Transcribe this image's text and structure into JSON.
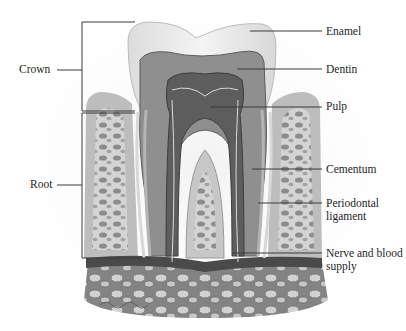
{
  "diagram": {
    "left_labels": [
      {
        "id": "crown",
        "text": "Crown"
      },
      {
        "id": "root",
        "text": "Root"
      }
    ],
    "right_labels": [
      {
        "id": "enamel",
        "text": "Enamel"
      },
      {
        "id": "dentin",
        "text": "Dentin"
      },
      {
        "id": "pulp",
        "text": "Pulp"
      },
      {
        "id": "cementum",
        "text": "Cementum"
      },
      {
        "id": "periodontal",
        "text": "Periodontal ligament"
      },
      {
        "id": "nerve",
        "text": "Nerve and blood supply"
      }
    ],
    "colors": {
      "background": "#ffffff",
      "enamel": "#ececec",
      "dentin": "#8f8f8f",
      "pulp": "#5e5e5e",
      "bone": "#d6d6d6",
      "gum": "#b8b8b8",
      "line": "#3a3a3a",
      "text": "#1f1f1f"
    }
  }
}
